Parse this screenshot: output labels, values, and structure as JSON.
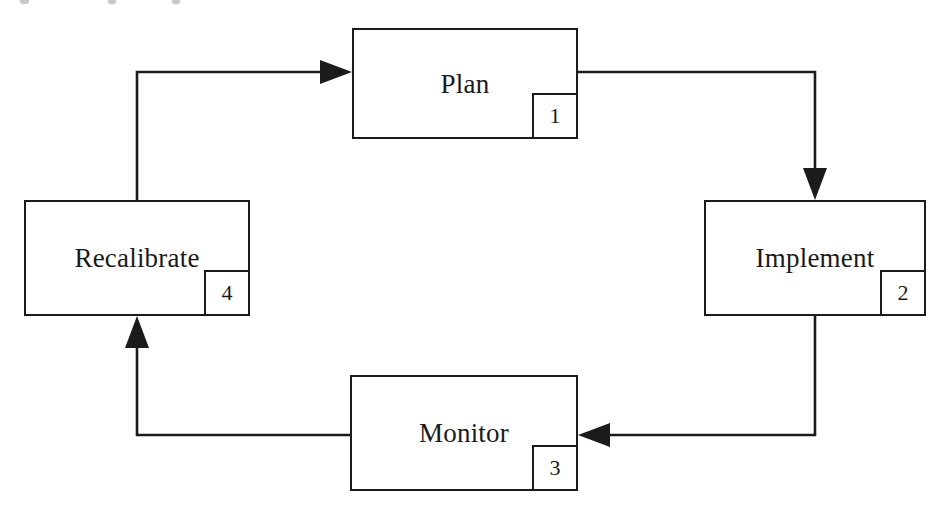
{
  "diagram": {
    "type": "cycle-flowchart",
    "direction": "clockwise",
    "stroke_color": "#1b1b1b",
    "background_color": "#ffffff",
    "nodes": [
      {
        "id": "plan",
        "label": "Plan",
        "number": "1",
        "x": 352,
        "y": 28,
        "w": 226,
        "h": 111
      },
      {
        "id": "implement",
        "label": "Implement",
        "number": "2",
        "x": 704,
        "y": 200,
        "w": 222,
        "h": 116
      },
      {
        "id": "monitor",
        "label": "Monitor",
        "number": "3",
        "x": 350,
        "y": 375,
        "w": 228,
        "h": 116
      },
      {
        "id": "recalibrate",
        "label": "Recalibrate",
        "number": "4",
        "x": 24,
        "y": 200,
        "w": 226,
        "h": 116
      }
    ],
    "edges": [
      {
        "id": "plan-to-implement",
        "from": "plan",
        "to": "implement",
        "arrow": "down"
      },
      {
        "id": "implement-to-monitor",
        "from": "implement",
        "to": "monitor",
        "arrow": "left"
      },
      {
        "id": "monitor-to-recalibrate",
        "from": "monitor",
        "to": "recalibrate",
        "arrow": "up"
      },
      {
        "id": "recalibrate-to-plan",
        "from": "recalibrate",
        "to": "plan",
        "arrow": "right"
      }
    ]
  }
}
